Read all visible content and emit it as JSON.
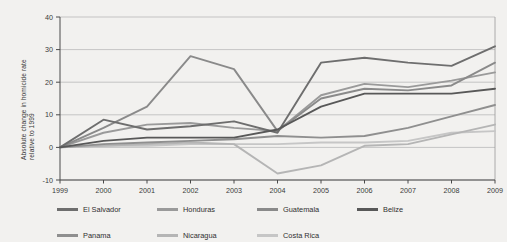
{
  "chart_data": {
    "type": "line",
    "title": "",
    "subtitle": "",
    "xlabel": "",
    "ylabel": "Absolute change in homicide rate relative to 1999",
    "ylabel_lines": [
      "Absolute change in homicide rate",
      "relative to 1999"
    ],
    "x": [
      1999,
      2000,
      2001,
      2002,
      2003,
      2004,
      2005,
      2006,
      2007,
      2008,
      2009
    ],
    "xtick_labels": [
      "1999",
      "2000",
      "2001",
      "2002",
      "2003",
      "2004",
      "2005",
      "2006",
      "2007",
      "2008",
      "2009"
    ],
    "ytick_labels": [
      "-10",
      "0",
      "10",
      "20",
      "30",
      "40"
    ],
    "yticks": [
      -10,
      0,
      10,
      20,
      30,
      40
    ],
    "ylim": [
      -10,
      40
    ],
    "xlim": [
      1999,
      2009
    ],
    "grid": "horizontal",
    "legend_position": "bottom",
    "legend_columns": 4,
    "series": [
      {
        "name": "El Salvador",
        "color": "#6e6e6e",
        "values": [
          0,
          8.5,
          5.5,
          6.5,
          8.0,
          4.5,
          26.0,
          27.5,
          26.0,
          25.0,
          31.0
        ]
      },
      {
        "name": "Honduras",
        "color": "#9a9a9a",
        "values": [
          0,
          4.5,
          7.0,
          7.5,
          6.0,
          5.0,
          16.0,
          19.5,
          18.5,
          20.5,
          23.0
        ]
      },
      {
        "name": "Guatemala",
        "color": "#8a8a8a",
        "values": [
          0,
          6.0,
          12.5,
          28.0,
          24.0,
          5.0,
          15.0,
          18.0,
          17.5,
          19.0,
          26.0
        ]
      },
      {
        "name": "Belize",
        "color": "#585858",
        "values": [
          0,
          2.0,
          3.0,
          3.0,
          3.0,
          5.5,
          12.5,
          16.5,
          16.5,
          16.5,
          18.0
        ]
      },
      {
        "name": "Panama",
        "color": "#8f8f8f",
        "values": [
          0,
          1.0,
          1.5,
          2.0,
          2.5,
          3.5,
          3.0,
          3.5,
          6.0,
          9.5,
          13.0
        ]
      },
      {
        "name": "Nicaragua",
        "color": "#b5b5b5",
        "values": [
          0,
          0.5,
          1.0,
          1.5,
          1.0,
          -8.0,
          -5.5,
          0.5,
          1.0,
          4.0,
          7.0
        ]
      },
      {
        "name": "Costa Rica",
        "color": "#c6c6c6",
        "values": [
          0,
          0.5,
          0.5,
          1.0,
          1.0,
          1.0,
          1.5,
          1.5,
          2.0,
          4.5,
          5.0
        ]
      }
    ]
  },
  "legend": {
    "rows": [
      [
        "El Salvador",
        "Honduras",
        "Guatemala",
        "Belize"
      ],
      [
        "Panama",
        "Nicaragua",
        "Costa Rica"
      ]
    ]
  }
}
